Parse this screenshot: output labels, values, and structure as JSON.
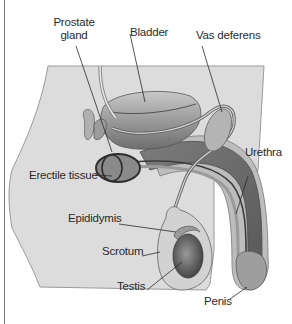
{
  "diagram": {
    "colors": {
      "body_fill": "#d9d9d9",
      "body_stroke": "#8a8a8a",
      "organ_dark": "#5a5a5a",
      "organ_mid": "#8f8f8f",
      "organ_light": "#bdbdbd",
      "label_text": "#2a2a2a",
      "leader_line": "#2a2a2a"
    },
    "labels": {
      "prostate_line1": "Prostate",
      "prostate_line2": "gland",
      "bladder": "Bladder",
      "vas_deferens": "Vas deferens",
      "urethra": "Urethra",
      "erectile_tissue": "Erectile tissue",
      "epididymis": "Epididymis",
      "scrotum": "Scrotum",
      "testis": "Testis",
      "penis": "Penis"
    }
  }
}
